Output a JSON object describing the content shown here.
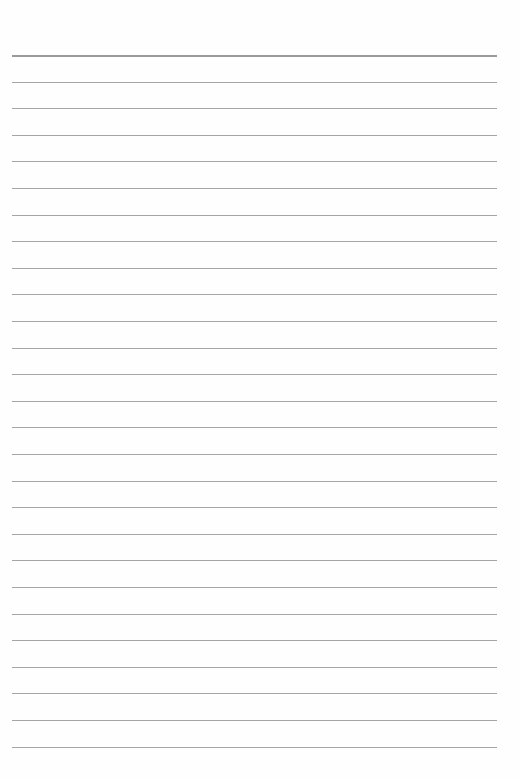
{
  "page": {
    "type": "lined-paper",
    "background_color": "#fefefe",
    "line_color": "#a6a6a6",
    "line_count": 27,
    "first_line_y": 55,
    "line_spacing": 26.6,
    "line_left": 12,
    "line_width": 485
  }
}
